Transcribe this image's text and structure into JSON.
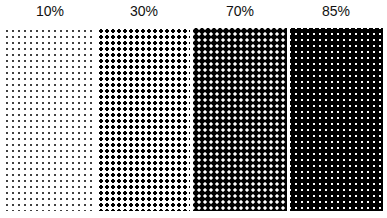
{
  "diagram": {
    "panels": [
      {
        "label": "10%",
        "coverage": 10
      },
      {
        "label": "30%",
        "coverage": 30
      },
      {
        "label": "70%",
        "coverage": 70
      },
      {
        "label": "85%",
        "coverage": 85
      }
    ]
  }
}
